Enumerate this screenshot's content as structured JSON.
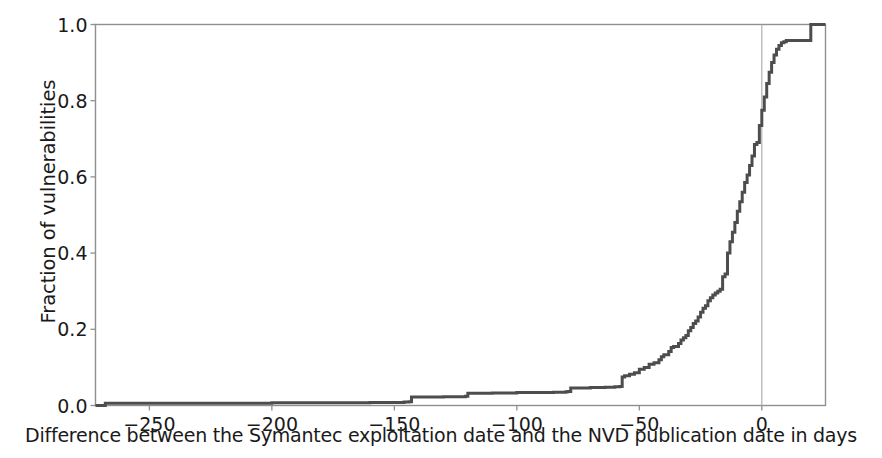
{
  "chart_data": {
    "type": "line",
    "title": "",
    "subtitle": "",
    "xlabel": "Difference between the Symantec exploitation date and the NVD publication date in days",
    "ylabel": "Fraction of vulnerabilities",
    "xlim": [
      -272,
      26
    ],
    "ylim": [
      0.0,
      1.0
    ],
    "xticks": [
      -250,
      -200,
      -150,
      -100,
      -50,
      0
    ],
    "xtick_labels": [
      "−250",
      "−200",
      "−150",
      "−100",
      "−50",
      "0"
    ],
    "yticks": [
      0.0,
      0.2,
      0.4,
      0.6,
      0.8,
      1.0
    ],
    "ytick_labels": [
      "0.0",
      "0.2",
      "0.4",
      "0.6",
      "0.8",
      "1.0"
    ],
    "grid": false,
    "legend": null,
    "legend_position": "none",
    "line_color": "#4d4d4d",
    "line_width": 3.0,
    "drawstyle": "steps-post",
    "annotations": [
      {
        "name": "zero-reference-line",
        "type": "vline",
        "x": 0,
        "color": "#b0b0b0",
        "width": 1.2
      }
    ],
    "series": [
      {
        "name": "Empirical CDF of exploitation-to-publication lag",
        "x": [
          -272,
          -268,
          -230,
          -200,
          -175,
          -160,
          -150,
          -146,
          -144,
          -143,
          -140,
          -130,
          -124,
          -121,
          -120,
          -118,
          -110,
          -100,
          -92,
          -85,
          -80,
          -79,
          -78,
          -77,
          -70,
          -64,
          -60,
          -58,
          -57,
          -56,
          -54,
          -52,
          -50,
          -48,
          -46,
          -44,
          -42,
          -41,
          -40,
          -38,
          -37,
          -36,
          -34,
          -33,
          -32,
          -31,
          -30,
          -29,
          -28,
          -27,
          -26,
          -25,
          -24,
          -23,
          -22,
          -21,
          -20,
          -19,
          -18,
          -17,
          -16,
          -15,
          -14,
          -13,
          -12,
          -11,
          -10,
          -9,
          -8,
          -7,
          -6,
          -5,
          -4,
          -3,
          -2,
          -1,
          0,
          1,
          2,
          3,
          4,
          5,
          6,
          7,
          8,
          9,
          10,
          11,
          14,
          20,
          26
        ],
        "y": [
          0.0,
          0.006,
          0.006,
          0.007,
          0.007,
          0.008,
          0.008,
          0.009,
          0.01,
          0.022,
          0.022,
          0.023,
          0.023,
          0.024,
          0.032,
          0.032,
          0.033,
          0.034,
          0.034,
          0.035,
          0.036,
          0.037,
          0.046,
          0.046,
          0.047,
          0.048,
          0.049,
          0.05,
          0.075,
          0.078,
          0.082,
          0.086,
          0.095,
          0.1,
          0.108,
          0.112,
          0.12,
          0.128,
          0.133,
          0.142,
          0.152,
          0.155,
          0.163,
          0.172,
          0.178,
          0.184,
          0.196,
          0.205,
          0.215,
          0.222,
          0.232,
          0.245,
          0.255,
          0.262,
          0.275,
          0.283,
          0.29,
          0.295,
          0.3,
          0.305,
          0.338,
          0.345,
          0.4,
          0.43,
          0.455,
          0.48,
          0.51,
          0.535,
          0.56,
          0.585,
          0.605,
          0.63,
          0.655,
          0.685,
          0.69,
          0.735,
          0.775,
          0.81,
          0.845,
          0.875,
          0.9,
          0.92,
          0.935,
          0.945,
          0.952,
          0.955,
          0.958,
          0.958,
          0.958,
          1.0,
          1.0
        ]
      }
    ]
  },
  "axes": {
    "frame_color": "#8f8f8f",
    "background": "#ffffff"
  }
}
